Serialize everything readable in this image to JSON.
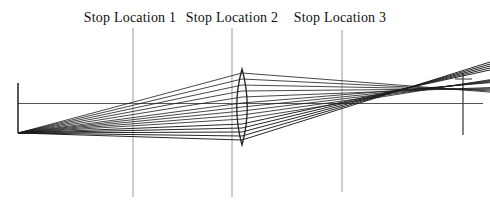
{
  "diagram": {
    "type": "optical-ray-trace",
    "labels": [
      {
        "text": "Stop Location 1",
        "x": 130
      },
      {
        "text": "Stop Location 2",
        "x": 232
      },
      {
        "text": "Stop Location 3",
        "x": 340
      }
    ],
    "stop_lines": [
      {
        "x": 133,
        "y1": 28,
        "y2": 197
      },
      {
        "x": 232,
        "y1": 28,
        "y2": 197
      },
      {
        "x": 342,
        "y1": 30,
        "y2": 192
      }
    ],
    "object_line": {
      "x": 18,
      "y1": 83,
      "y2": 133
    },
    "axis_line": {
      "x1": 18,
      "y": 103.5,
      "x2": 483
    },
    "image_plane": {
      "x": 463,
      "y1": 73,
      "y2": 135,
      "tick_y": 79,
      "tick_x1": 455,
      "tick_x2": 472
    },
    "lens": {
      "cx": 242,
      "top_y": 69,
      "bottom_y": 145,
      "half_width": 10.5
    },
    "origin": {
      "x": 18,
      "y": 133
    },
    "ray_end_x": 490,
    "bundles": [
      {
        "name": "upper-bundle",
        "stroke_width": 0.85,
        "rays": [
          {
            "lens_y": 73,
            "end_y": 92.1
          },
          {
            "lens_y": 79,
            "end_y": 90.9
          },
          {
            "lens_y": 85,
            "end_y": 89.8
          },
          {
            "lens_y": 91,
            "end_y": 88.6
          },
          {
            "lens_y": 97,
            "end_y": 87.5
          }
        ]
      },
      {
        "name": "middle-bundle",
        "stroke_width": 0.85,
        "rays": [
          {
            "lens_y": 103,
            "end_y": 82.7
          },
          {
            "lens_y": 107,
            "end_y": 82.0
          },
          {
            "lens_y": 111,
            "end_y": 81.2
          },
          {
            "lens_y": 115,
            "end_y": 80.4
          },
          {
            "lens_y": 119,
            "end_y": 79.7
          }
        ]
      },
      {
        "name": "lower-bundle",
        "stroke_width": 1.0,
        "rays": [
          {
            "lens_y": 124,
            "end_y": 70
          },
          {
            "lens_y": 128,
            "end_y": 68
          },
          {
            "lens_y": 132,
            "end_y": 66
          },
          {
            "lens_y": 136,
            "end_y": 64
          },
          {
            "lens_y": 140,
            "end_y": 62
          }
        ]
      }
    ],
    "colors": {
      "ray": "#1b1b1b",
      "stop_line": "#9a9a9a",
      "axis": "#555555",
      "object_line": "#222222",
      "image_plane": "#333333",
      "lens_outline": "#222222",
      "text": "#111111",
      "background": "#ffffff"
    }
  }
}
